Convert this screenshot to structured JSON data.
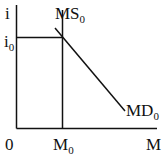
{
  "diagram": {
    "type": "money-market",
    "y_axis_label": "i",
    "x_axis_label": "M",
    "origin_label": "0",
    "equilibrium_rate": {
      "base": "i",
      "sub": "0"
    },
    "equilibrium_quantity": {
      "base": "M",
      "sub": "0"
    },
    "supply_curve": {
      "base": "MS",
      "sub": "0"
    },
    "demand_curve": {
      "base": "MD",
      "sub": "0"
    }
  },
  "colors": {
    "ink": "#111111",
    "background": "#ffffff"
  }
}
